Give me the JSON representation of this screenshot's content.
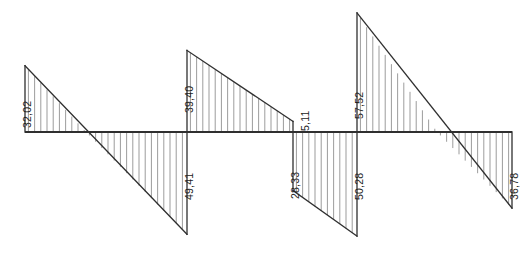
{
  "figure": {
    "kind": "shear-force-diagram",
    "title": "",
    "baseline_label": ""
  },
  "colors": {
    "outline": "#2f2f2f",
    "baseline": "#2f2f2f",
    "hatch": "#8a8a8a",
    "text": "#1c1c1c",
    "background": "#ffffff"
  },
  "labels": [
    {
      "id": "v-32-02",
      "text": "32,02",
      "x": 22,
      "y": 128,
      "sign": "positive"
    },
    {
      "id": "v-49-41",
      "text": "49,41",
      "x": 184,
      "y": 200,
      "sign": "negative"
    },
    {
      "id": "v-39-40",
      "text": "39,40",
      "x": 184,
      "y": 113,
      "sign": "positive"
    },
    {
      "id": "v-5-11",
      "text": "5,11",
      "x": 300,
      "y": 131,
      "sign": "positive"
    },
    {
      "id": "v-28-33",
      "text": "28,33",
      "x": 290,
      "y": 199,
      "sign": "negative"
    },
    {
      "id": "v-50-28",
      "text": "50,28",
      "x": 354,
      "y": 200,
      "sign": "negative"
    },
    {
      "id": "v-57-52",
      "text": "57,52",
      "x": 354,
      "y": 119,
      "sign": "positive"
    },
    {
      "id": "v-36-78",
      "text": "36,78",
      "x": 509,
      "y": 200,
      "sign": "negative"
    }
  ],
  "chart_data": {
    "type": "line",
    "xlabel": "",
    "ylabel": "Shear force",
    "grid": false,
    "legend_position": "none",
    "axis_baseline": 0,
    "y_unit_px": 2.07,
    "baseline_y_px": 132,
    "ylim": [
      -57.52,
      57.52
    ],
    "supports_x_px": [
      25,
      187,
      293,
      357,
      512
    ],
    "zero_crossings_x_px": [
      86,
      437
    ],
    "segments": [
      {
        "name": "span-1",
        "x_start_px": 25,
        "x_end_px": 187,
        "value_start": 32.02,
        "value_end": -49.41,
        "zero_crossing_x_px": 86,
        "hatched": true
      },
      {
        "name": "span-2",
        "x_start_px": 187,
        "x_end_px": 293,
        "value_start": 39.4,
        "value_end": 5.11,
        "zero_crossing_x_px": null,
        "hatched": true
      },
      {
        "name": "span-3",
        "x_start_px": 293,
        "x_end_px": 357,
        "value_start": -28.33,
        "value_end": -50.28,
        "zero_crossing_x_px": null,
        "hatched": true
      },
      {
        "name": "span-4",
        "x_start_px": 357,
        "x_end_px": 512,
        "value_start": 57.52,
        "value_end": -36.78,
        "zero_crossing_x_px": 437,
        "hatched": true
      }
    ],
    "annotated_values": [
      32.02,
      49.41,
      39.4,
      5.11,
      28.33,
      50.28,
      57.52,
      36.78
    ]
  }
}
